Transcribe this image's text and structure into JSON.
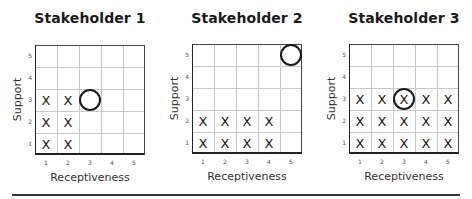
{
  "chart_data": [
    {
      "type": "scatter",
      "title": "Stakeholder 1",
      "xlabel": "Receptiveness",
      "ylabel": "Support",
      "x_ticks": [
        "1",
        "2",
        "3",
        "4",
        "5"
      ],
      "y_ticks": [
        "1",
        "2",
        "3",
        "4",
        "5"
      ],
      "xlim": [
        1,
        5
      ],
      "ylim": [
        1,
        5
      ],
      "grid": true,
      "x_marks": [
        [
          1,
          1
        ],
        [
          1,
          2
        ],
        [
          1,
          3
        ],
        [
          2,
          1
        ],
        [
          2,
          2
        ],
        [
          2,
          3
        ]
      ],
      "circle": [
        3,
        3
      ]
    },
    {
      "type": "scatter",
      "title": "Stakeholder 2",
      "xlabel": "Receptiveness",
      "ylabel": "Support",
      "x_ticks": [
        "1",
        "2",
        "3",
        "4",
        "5"
      ],
      "y_ticks": [
        "1",
        "2",
        "3",
        "4",
        "5"
      ],
      "xlim": [
        1,
        5
      ],
      "ylim": [
        1,
        5
      ],
      "grid": true,
      "x_marks": [
        [
          1,
          1
        ],
        [
          1,
          2
        ],
        [
          2,
          1
        ],
        [
          2,
          2
        ],
        [
          3,
          1
        ],
        [
          3,
          2
        ],
        [
          4,
          1
        ],
        [
          4,
          2
        ]
      ],
      "circle": [
        5,
        5
      ]
    },
    {
      "type": "scatter",
      "title": "Stakeholder 3",
      "xlabel": "Receptiveness",
      "ylabel": "Support",
      "x_ticks": [
        "1",
        "2",
        "3",
        "4",
        "5"
      ],
      "y_ticks": [
        "1",
        "2",
        "3",
        "4",
        "5"
      ],
      "xlim": [
        1,
        5
      ],
      "ylim": [
        1,
        5
      ],
      "grid": true,
      "x_marks": [
        [
          1,
          1
        ],
        [
          1,
          2
        ],
        [
          1,
          3
        ],
        [
          2,
          1
        ],
        [
          2,
          2
        ],
        [
          2,
          3
        ],
        [
          3,
          1
        ],
        [
          3,
          2
        ],
        [
          3,
          3
        ],
        [
          4,
          1
        ],
        [
          4,
          2
        ],
        [
          4,
          3
        ],
        [
          5,
          1
        ],
        [
          5,
          2
        ],
        [
          5,
          3
        ]
      ],
      "circle": [
        3,
        3
      ]
    }
  ],
  "panels": [
    {
      "title": "Stakeholder 1",
      "xlabel": "Receptiveness",
      "ylabel": "Support",
      "grid_left": 35,
      "grid_top": 45
    },
    {
      "title": "Stakeholder 2",
      "xlabel": "Receptiveness",
      "ylabel": "Support",
      "grid_left": 192,
      "grid_top": 44
    },
    {
      "title": "Stakeholder 3",
      "xlabel": "Receptiveness",
      "ylabel": "Support",
      "grid_left": 349,
      "grid_top": 44
    }
  ],
  "mark_symbol": "X",
  "ticks": [
    "1",
    "2",
    "3",
    "4",
    "5"
  ]
}
